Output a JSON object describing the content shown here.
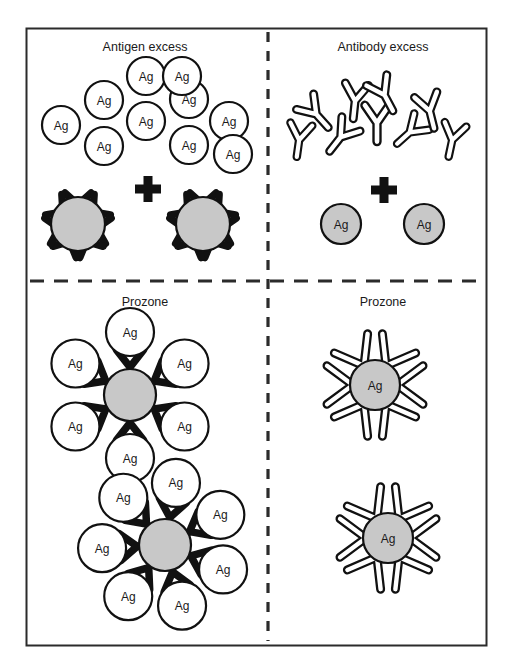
{
  "figure": {
    "type": "immunology-precipitin-diagram",
    "background_color": "#ffffff",
    "frame": {
      "stroke_color": "#2b2b2b",
      "fill_color": "#ffffff",
      "x": 26,
      "y": 28,
      "width": 460,
      "height": 617
    },
    "dividers": {
      "vertical": {
        "x": 268,
        "y1": 32,
        "y2": 641,
        "dash": "10 9",
        "color": "#2b2b2b"
      },
      "horizontal": {
        "y": 281,
        "x1": 30,
        "x2": 482,
        "dash": "14 10",
        "color": "#2b2b2b"
      }
    },
    "colors": {
      "antigen_gray": "#c8c8c8",
      "outline_black": "#111111",
      "antibody_fill_white": "#ffffff",
      "text": "#1a1a1a"
    }
  },
  "panels": [
    {
      "id": "top-left",
      "title": "Antigen excess",
      "title_x": 145,
      "title_y": 48,
      "free_antigens": [
        {
          "cx": 61,
          "cy": 125,
          "r": 19,
          "label": "Ag"
        },
        {
          "cx": 104,
          "cy": 100,
          "r": 19,
          "label": "Ag"
        },
        {
          "cx": 104,
          "cy": 146,
          "r": 19,
          "label": "Ag"
        },
        {
          "cx": 146,
          "cy": 121,
          "r": 19,
          "label": "Ag"
        },
        {
          "cx": 146,
          "cy": 76,
          "r": 19,
          "label": "Ag"
        },
        {
          "cx": 189,
          "cy": 99,
          "r": 19,
          "label": "Ag"
        },
        {
          "cx": 189,
          "cy": 145,
          "r": 19,
          "label": "Ag"
        },
        {
          "cx": 182,
          "cy": 76,
          "r": 19,
          "label": "Ag"
        },
        {
          "cx": 229,
          "cy": 121,
          "r": 19,
          "label": "Ag"
        },
        {
          "cx": 233,
          "cy": 154,
          "r": 19,
          "label": "Ag"
        }
      ],
      "plus_sign": {
        "cx": 148,
        "cy": 189,
        "size": 26,
        "arm": 9
      },
      "complexes": [
        {
          "cx": 78,
          "cy": 224,
          "r": 27,
          "label": "",
          "arms": 7,
          "arm_style": "filled-black",
          "arm_length": 31
        },
        {
          "cx": 203,
          "cy": 224,
          "r": 27,
          "label": "",
          "arms": 7,
          "arm_style": "filled-black",
          "arm_length": 31
        }
      ]
    },
    {
      "id": "top-right",
      "title": "Antibody excess",
      "title_x": 383,
      "title_y": 48,
      "free_antibodies": [
        {
          "cx": 299,
          "cy": 141,
          "rot": 8,
          "scale": 1.0
        },
        {
          "cx": 317,
          "cy": 115,
          "rot": -42,
          "scale": 1.05
        },
        {
          "cx": 340,
          "cy": 138,
          "rot": 38,
          "scale": 1.05
        },
        {
          "cx": 355,
          "cy": 102,
          "rot": 6,
          "scale": 1.05
        },
        {
          "cx": 377,
          "cy": 124,
          "rot": 0,
          "scale": 1.1
        },
        {
          "cx": 385,
          "cy": 96,
          "rot": -28,
          "scale": 1.05
        },
        {
          "cx": 409,
          "cy": 133,
          "rot": 48,
          "scale": 1.0
        },
        {
          "cx": 430,
          "cy": 112,
          "rot": -14,
          "scale": 1.05
        },
        {
          "cx": 452,
          "cy": 141,
          "rot": 12,
          "scale": 1.0
        }
      ],
      "plus_sign": {
        "cx": 384,
        "cy": 190,
        "size": 26,
        "arm": 9
      },
      "antigens": [
        {
          "cx": 341,
          "cy": 224,
          "r": 20,
          "label": "Ag"
        },
        {
          "cx": 424,
          "cy": 224,
          "r": 20,
          "label": "Ag"
        }
      ]
    },
    {
      "id": "bottom-left",
      "title": "Prozone",
      "title_x": 145,
      "title_y": 303,
      "lattices": [
        {
          "center": {
            "cx": 130,
            "cy": 395,
            "r": 26,
            "label": ""
          },
          "satellite_r": 24,
          "orbit": 63,
          "count": 6,
          "start_angle": -90,
          "label": "Ag"
        },
        {
          "center": {
            "cx": 165,
            "cy": 545,
            "r": 26,
            "label": ""
          },
          "satellite_r": 24,
          "orbit": 63,
          "count": 7,
          "start_angle": -80,
          "label": "Ag"
        }
      ]
    },
    {
      "id": "bottom-right",
      "title": "Prozone",
      "title_x": 383,
      "title_y": 303,
      "clusters": [
        {
          "center": {
            "cx": 375,
            "cy": 385,
            "r": 25,
            "label": "Ag"
          },
          "arms": 6,
          "arm_length": 48,
          "start_angle": 0,
          "arm_style": "outline-white"
        },
        {
          "center": {
            "cx": 388,
            "cy": 538,
            "r": 25,
            "label": "Ag"
          },
          "arms": 6,
          "arm_length": 48,
          "start_angle": 0,
          "arm_style": "outline-white"
        }
      ]
    }
  ]
}
